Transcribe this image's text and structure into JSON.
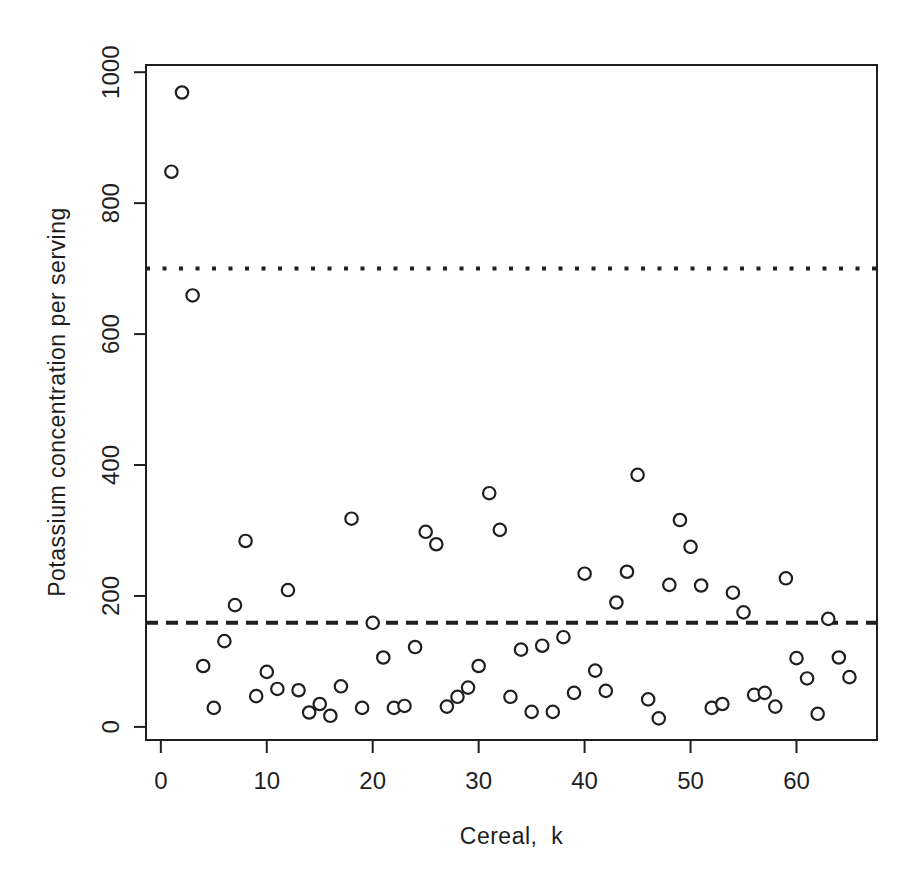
{
  "colors": {
    "ink": "#1f1f1f",
    "background": "#ffffff"
  },
  "chart_data": {
    "type": "scatter",
    "title": "",
    "xlabel": "Cereal,  k",
    "ylabel": "Potassium concentration per serving",
    "x_ticks": [
      0,
      10,
      20,
      30,
      40,
      50,
      60
    ],
    "y_ticks": [
      0,
      200,
      400,
      600,
      800,
      1000
    ],
    "xlim": [
      -1.4,
      67.6
    ],
    "ylim": [
      -20,
      1011
    ],
    "grid": false,
    "legend": "none",
    "marker": "open-circle",
    "series": [
      {
        "name": "potassium-per-serving",
        "x": [
          1,
          2,
          3,
          4,
          5,
          6,
          7,
          8,
          9,
          10,
          11,
          12,
          13,
          14,
          15,
          16,
          17,
          18,
          19,
          20,
          21,
          22,
          23,
          24,
          25,
          26,
          27,
          28,
          29,
          30,
          31,
          32,
          33,
          34,
          35,
          36,
          37,
          38,
          39,
          40,
          41,
          42,
          43,
          44,
          45,
          46,
          47,
          48,
          49,
          50,
          51,
          52,
          53,
          54,
          55,
          56,
          57,
          58,
          59,
          60,
          61,
          62,
          63,
          64,
          65
        ],
        "y": [
          848,
          969,
          659,
          93,
          29,
          131,
          186,
          284,
          47,
          84,
          58,
          209,
          56,
          22,
          35,
          17,
          62,
          318,
          29,
          159,
          106,
          29,
          32,
          122,
          298,
          279,
          31,
          46,
          60,
          93,
          357,
          301,
          46,
          118,
          23,
          124,
          23,
          137,
          52,
          234,
          86,
          55,
          190,
          237,
          385,
          42,
          13,
          217,
          316,
          275,
          216,
          29,
          35,
          205,
          175,
          49,
          52,
          31,
          227,
          105,
          74,
          20,
          165,
          106,
          76
        ]
      }
    ],
    "reference_lines": [
      {
        "name": "upper-reference-line",
        "y": 700,
        "style": "dotted"
      },
      {
        "name": "mean-reference-line",
        "y": 159,
        "style": "dashed"
      }
    ]
  }
}
